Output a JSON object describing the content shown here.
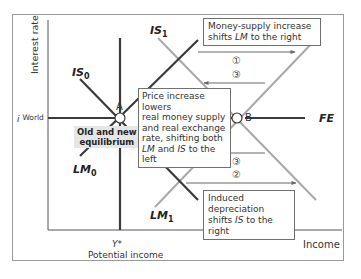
{
  "diagram": {
    "axes": {
      "y_label": "Interest rate",
      "x_label": "Income",
      "i_world_symbol": "i",
      "i_world_label": "World",
      "y_star": "Y*",
      "potential_income": "Potential income"
    },
    "curves": {
      "IS0": {
        "base": "IS",
        "sub": "0"
      },
      "IS1": {
        "base": "IS",
        "sub": "1"
      },
      "LM0": {
        "base": "LM",
        "sub": "0"
      },
      "LM1": {
        "base": "LM",
        "sub": "1"
      },
      "FE": "FE"
    },
    "points": {
      "A": "A",
      "B": "B"
    },
    "annotations": {
      "money_supply_line1": "Money-supply increase",
      "money_supply_line2_pre": "shifts ",
      "money_supply_line2_em": "LM",
      "money_supply_line2_post": " to the right",
      "price_line1": "Price increase lowers",
      "price_line2": "real money supply",
      "price_line3": "and real exchange",
      "price_line4": "rate, shifting both",
      "price_line5_em1": "LM",
      "price_line5_mid": " and ",
      "price_line5_em2": "IS",
      "price_line5_post": " to the left",
      "depreciation_line1": "Induced depreciation",
      "depreciation_line2_pre": "shifts ",
      "depreciation_line2_em": "IS",
      "depreciation_line2_post": " to the right",
      "equilibrium_line1": "Old and new",
      "equilibrium_line2": "equilibrium"
    },
    "steps": {
      "step1": "①",
      "step2": "②",
      "step3a": "③",
      "step3b": "③"
    },
    "colors": {
      "dark_line": "#3a3a3a",
      "light_line": "#a8a8a8",
      "axis": "#555555",
      "arrow": "#666666",
      "eq_box_bg": "#e6e6e6"
    }
  }
}
